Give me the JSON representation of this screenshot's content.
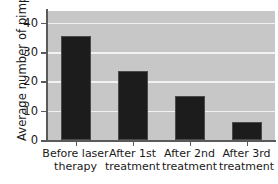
{
  "chart_data": {
    "type": "bar",
    "title": "",
    "xlabel": "",
    "ylabel": "Average number of pimples",
    "categories": [
      "Before laser therapy",
      "After 1st treatment",
      "After 2nd treatment",
      "After 3rd treatment"
    ],
    "category_lines": [
      [
        "Before laser",
        "therapy"
      ],
      [
        "After 1st",
        "treatment"
      ],
      [
        "After 2nd",
        "treatment"
      ],
      [
        "After 3rd",
        "treatment"
      ]
    ],
    "values": [
      35.5,
      23.5,
      15,
      6
    ],
    "ylim": [
      0,
      44
    ],
    "yticks": [
      0,
      10,
      20,
      30,
      40
    ],
    "ytick_labels": [
      "0",
      "10",
      "20",
      "30",
      "40"
    ],
    "grid": true,
    "grid_color": "#f2f2f2",
    "legend": null,
    "colors": {
      "bar": "#1c1c1c",
      "bar_edge": "#4a4a4a",
      "plot_background": "#c7c7c7",
      "axis": "#5a5a5a",
      "text": "#1a1a1a",
      "page_background": "#ffffff"
    }
  }
}
